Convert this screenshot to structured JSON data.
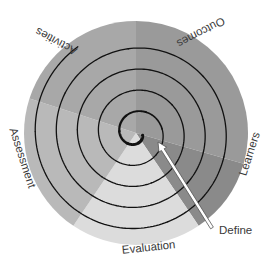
{
  "diagram": {
    "center": {
      "x": 136,
      "y": 133
    },
    "radius": 112,
    "sectors": [
      {
        "name": "Outcomes",
        "start": 0,
        "end": 106,
        "color": "#9a9a9a"
      },
      {
        "name": "Learners",
        "start": 106,
        "end": 146,
        "color": "#8a8a8a"
      },
      {
        "name": "Evaluation",
        "start": 146,
        "end": 214,
        "color": "#dcdcdc"
      },
      {
        "name": "Assessment",
        "start": 214,
        "end": 288,
        "color": "#b9b9b9"
      },
      {
        "name": "Activities",
        "start": 288,
        "end": 360,
        "color": "#a8a8a8"
      }
    ],
    "labels": {
      "activities": "Activities",
      "outcomes": "Outcomes",
      "learners": "Learners",
      "assessment": "Assessment",
      "evaluation": "Evaluation",
      "define": "Define"
    },
    "spiral": {
      "turns": 4.6,
      "start_radius": 7,
      "end_radius": 104,
      "start_angle": 110,
      "inner_thick_width": 3.2,
      "outer_width": 1.3,
      "color": "#111111"
    },
    "define_arrow": {
      "from": {
        "x": 212,
        "y": 228
      },
      "to": {
        "x": 158,
        "y": 142
      },
      "color": "#555555"
    }
  }
}
